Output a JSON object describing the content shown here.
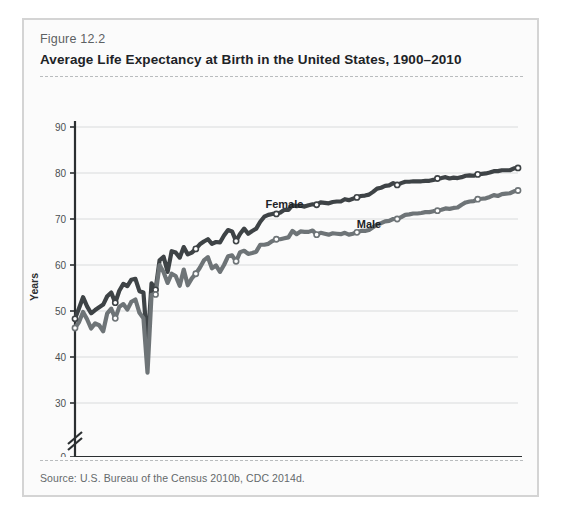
{
  "figure": {
    "number_label": "Figure 12.2",
    "title": "Average Life Expectancy at Birth in the United States, 1900–2010",
    "source": "Source: U.S. Bureau of the Census 2010b, CDC 2014d."
  },
  "chart_data": {
    "type": "line",
    "title": "Average Life Expectancy at Birth in the United States, 1900–2010",
    "xlabel": "",
    "ylabel": "Years",
    "xlim": [
      1900,
      2010
    ],
    "ylim": [
      28,
      91
    ],
    "y_axis_break": true,
    "y_axis_break_note": "axis broken between 0 and 30",
    "grid": "horizontal",
    "legend_position": "inline-annotations",
    "xticks": [
      1900,
      1910,
      1920,
      1930,
      1940,
      1950,
      1960,
      1970,
      1980,
      1990,
      2000,
      2010
    ],
    "yticks": [
      0,
      30,
      40,
      50,
      60,
      70,
      80,
      90
    ],
    "annotations": [
      {
        "text": "Female",
        "x": 1952,
        "y": 72.5
      },
      {
        "text": "Male",
        "x": 1973,
        "y": 68.0
      }
    ],
    "series": [
      {
        "name": "Female",
        "color": "#3e4346",
        "marker_years": [
          1900,
          1910,
          1920,
          1930,
          1940,
          1950,
          1960,
          1970,
          1980,
          1990,
          2000,
          2010
        ],
        "x": [
          1900,
          1901,
          1902,
          1903,
          1904,
          1905,
          1906,
          1907,
          1908,
          1909,
          1910,
          1911,
          1912,
          1913,
          1914,
          1915,
          1916,
          1917,
          1918,
          1919,
          1920,
          1921,
          1922,
          1923,
          1924,
          1925,
          1926,
          1927,
          1928,
          1929,
          1930,
          1931,
          1932,
          1933,
          1934,
          1935,
          1936,
          1937,
          1938,
          1939,
          1940,
          1941,
          1942,
          1943,
          1944,
          1945,
          1946,
          1947,
          1948,
          1949,
          1950,
          1951,
          1952,
          1953,
          1954,
          1955,
          1956,
          1957,
          1958,
          1959,
          1960,
          1961,
          1962,
          1963,
          1964,
          1965,
          1966,
          1967,
          1968,
          1969,
          1970,
          1971,
          1972,
          1973,
          1974,
          1975,
          1976,
          1977,
          1978,
          1979,
          1980,
          1981,
          1982,
          1983,
          1984,
          1985,
          1986,
          1987,
          1988,
          1989,
          1990,
          1991,
          1992,
          1993,
          1994,
          1995,
          1996,
          1997,
          1998,
          1999,
          2000,
          2001,
          2002,
          2003,
          2004,
          2005,
          2006,
          2007,
          2008,
          2009,
          2010
        ],
        "y": [
          48.3,
          50.6,
          53.0,
          51.0,
          49.5,
          50.2,
          50.8,
          51.4,
          53.2,
          54.0,
          51.8,
          54.4,
          55.9,
          55.4,
          56.8,
          57.0,
          54.3,
          54.0,
          42.2,
          56.0,
          54.6,
          61.0,
          61.8,
          58.5,
          63.0,
          62.7,
          61.6,
          63.9,
          62.3,
          62.7,
          63.5,
          64.5,
          65.1,
          65.6,
          64.6,
          65.0,
          64.9,
          66.4,
          67.6,
          67.3,
          65.2,
          66.8,
          67.9,
          66.8,
          67.4,
          67.9,
          69.4,
          70.5,
          70.9,
          71.1,
          71.1,
          71.4,
          72.0,
          72.0,
          73.0,
          72.8,
          72.9,
          72.7,
          73.0,
          73.2,
          73.1,
          73.6,
          73.5,
          73.4,
          73.7,
          73.8,
          73.8,
          74.3,
          74.1,
          74.4,
          74.7,
          75.0,
          75.1,
          75.3,
          75.9,
          76.6,
          76.8,
          77.2,
          77.3,
          77.8,
          77.4,
          77.8,
          78.1,
          78.1,
          78.2,
          78.2,
          78.2,
          78.3,
          78.3,
          78.5,
          78.8,
          78.9,
          79.1,
          78.8,
          79.0,
          78.9,
          79.1,
          79.4,
          79.5,
          79.4,
          79.7,
          79.8,
          79.9,
          80.1,
          80.4,
          80.4,
          80.6,
          80.6,
          80.6,
          81.0,
          81.1
        ]
      },
      {
        "name": "Male",
        "color": "#6e7477",
        "marker_years": [
          1900,
          1910,
          1920,
          1930,
          1940,
          1950,
          1960,
          1970,
          1980,
          1990,
          2000,
          2010
        ],
        "x": [
          1900,
          1901,
          1902,
          1903,
          1904,
          1905,
          1906,
          1907,
          1908,
          1909,
          1910,
          1911,
          1912,
          1913,
          1914,
          1915,
          1916,
          1917,
          1918,
          1919,
          1920,
          1921,
          1922,
          1923,
          1924,
          1925,
          1926,
          1927,
          1928,
          1929,
          1930,
          1931,
          1932,
          1933,
          1934,
          1935,
          1936,
          1937,
          1938,
          1939,
          1940,
          1941,
          1942,
          1943,
          1944,
          1945,
          1946,
          1947,
          1948,
          1949,
          1950,
          1951,
          1952,
          1953,
          1954,
          1955,
          1956,
          1957,
          1958,
          1959,
          1960,
          1961,
          1962,
          1963,
          1964,
          1965,
          1966,
          1967,
          1968,
          1969,
          1970,
          1971,
          1972,
          1973,
          1974,
          1975,
          1976,
          1977,
          1978,
          1979,
          1980,
          1981,
          1982,
          1983,
          1984,
          1985,
          1986,
          1987,
          1988,
          1989,
          1990,
          1991,
          1992,
          1993,
          1994,
          1995,
          1996,
          1997,
          1998,
          1999,
          2000,
          2001,
          2002,
          2003,
          2004,
          2005,
          2006,
          2007,
          2008,
          2009,
          2010
        ],
        "y": [
          46.3,
          47.6,
          49.8,
          48.2,
          46.2,
          47.3,
          46.9,
          45.6,
          49.5,
          50.5,
          48.4,
          50.9,
          51.5,
          50.3,
          52.0,
          52.5,
          49.6,
          48.4,
          36.6,
          53.5,
          53.6,
          60.0,
          58.4,
          56.1,
          58.1,
          57.6,
          55.5,
          59.0,
          55.6,
          57.1,
          58.1,
          59.4,
          61.0,
          61.7,
          59.3,
          59.9,
          58.5,
          60.0,
          61.9,
          62.1,
          60.8,
          62.8,
          63.1,
          62.4,
          62.6,
          62.9,
          64.4,
          64.4,
          64.6,
          65.2,
          65.6,
          65.6,
          65.8,
          66.0,
          67.4,
          66.7,
          67.3,
          67.2,
          67.2,
          67.5,
          66.6,
          67.0,
          66.8,
          66.6,
          66.9,
          66.8,
          66.7,
          67.0,
          66.6,
          66.8,
          67.1,
          67.4,
          67.4,
          67.6,
          68.2,
          68.8,
          69.1,
          69.5,
          69.6,
          70.0,
          70.0,
          70.4,
          70.9,
          71.0,
          71.2,
          71.2,
          71.3,
          71.5,
          71.5,
          71.7,
          71.8,
          72.0,
          72.3,
          72.2,
          72.4,
          72.5,
          73.1,
          73.6,
          73.8,
          73.9,
          74.3,
          74.4,
          74.5,
          74.8,
          75.2,
          75.0,
          75.4,
          75.5,
          75.6,
          76.0,
          76.2
        ]
      }
    ]
  }
}
